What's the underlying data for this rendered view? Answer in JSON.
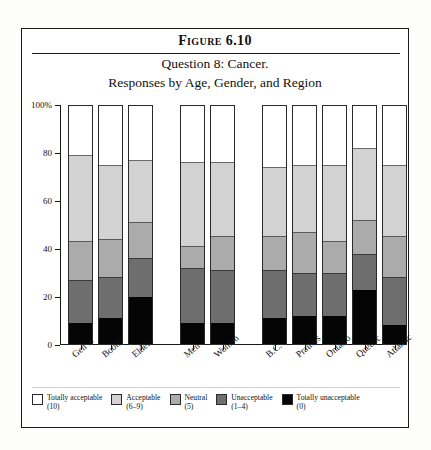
{
  "figure": {
    "number": "Figure 6.10",
    "title_line1": "Question 8: Cancer.",
    "title_line2": "Responses by Age, Gender, and Region"
  },
  "chart_data": {
    "type": "bar",
    "stacked": true,
    "normalized_percent": true,
    "title": "Question 8: Cancer. Responses by Age, Gender, and Region",
    "xlabel": "",
    "ylabel": "",
    "ylim": [
      0,
      100
    ],
    "grid": false,
    "legend_position": "bottom",
    "ytick_labels": [
      "0",
      "20",
      "40",
      "60",
      "80",
      "100%"
    ],
    "ytick_values": [
      0,
      20,
      40,
      60,
      80,
      100
    ],
    "categories": [
      "Gen X",
      "Boom",
      "Elders",
      "Men",
      "Women",
      "B.C.",
      "Prairies",
      "Ontario",
      "Quebec",
      "Atlantic"
    ],
    "groups": [
      {
        "name": "Age",
        "categories": [
          "Gen X",
          "Boom",
          "Elders"
        ]
      },
      {
        "name": "Gender",
        "categories": [
          "Men",
          "Women"
        ]
      },
      {
        "name": "Region",
        "categories": [
          "B.C.",
          "Prairies",
          "Ontario",
          "Quebec",
          "Atlantic"
        ]
      }
    ],
    "series": [
      {
        "name": "Totally acceptable",
        "score": "(10)",
        "color": "#ffffff",
        "values": [
          21,
          25,
          23,
          24,
          24,
          26,
          25,
          25,
          18,
          25
        ]
      },
      {
        "name": "Acceptable",
        "score": "(6–9)",
        "color": "#d2d2d2",
        "values": [
          36,
          31,
          26,
          35,
          31,
          29,
          28,
          32,
          30,
          30
        ]
      },
      {
        "name": "Neutral",
        "score": "(5)",
        "color": "#ababab",
        "values": [
          16,
          16,
          15,
          9,
          14,
          14,
          17,
          13,
          14,
          17
        ]
      },
      {
        "name": "Unacceptable",
        "score": "(1–4)",
        "color": "#6e6e6e",
        "values": [
          18,
          17,
          16,
          23,
          22,
          20,
          18,
          18,
          15,
          20
        ]
      },
      {
        "name": "Totally unacceptable",
        "score": "(0)",
        "color": "#050505",
        "values": [
          9,
          11,
          20,
          9,
          9,
          11,
          12,
          12,
          23,
          8
        ]
      }
    ]
  },
  "legend": {
    "items": [
      {
        "label": "Totally acceptable",
        "score": "(10)"
      },
      {
        "label": "Acceptable",
        "score": "(6–9)"
      },
      {
        "label": "Neutral",
        "score": "(5)"
      },
      {
        "label": "Unacceptable",
        "score": "(1–4)"
      },
      {
        "label": "Totally unacceptable",
        "score": "(0)"
      }
    ]
  }
}
